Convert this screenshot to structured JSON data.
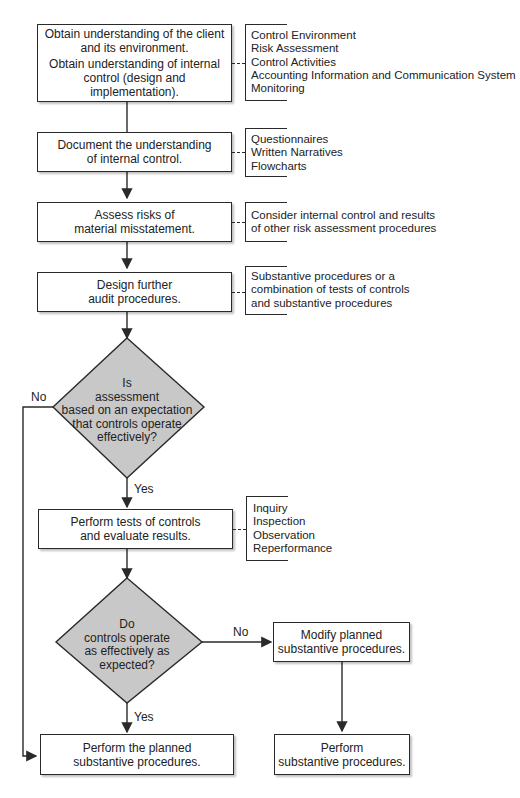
{
  "flowchart": {
    "steps": {
      "obtain": {
        "lines": [
          "Obtain understanding of the client",
          "and its environment.",
          "Obtain understanding of internal",
          "control (design and implementation)."
        ]
      },
      "document": {
        "lines": [
          "Document the understanding",
          "of internal control."
        ]
      },
      "assess": {
        "lines": [
          "Assess risks of",
          "material misstatement."
        ]
      },
      "design": {
        "lines": [
          "Design further",
          "audit procedures."
        ]
      },
      "tests": {
        "lines": [
          "Perform tests of controls",
          "and evaluate results."
        ]
      },
      "perform_planned": {
        "lines": [
          "Perform the planned",
          "substantive procedures."
        ]
      },
      "modify": {
        "lines": [
          "Modify planned",
          "substantive procedures."
        ]
      },
      "perform_sub": {
        "lines": [
          "Perform",
          "substantive procedures."
        ]
      }
    },
    "decisions": {
      "d1": {
        "lines": [
          "Is",
          "assessment",
          "based on an expectation",
          "that controls operate",
          "effectively?"
        ],
        "no": "No",
        "yes": "Yes"
      },
      "d2": {
        "lines": [
          "Do",
          "controls operate",
          "as effectively as",
          "expected?"
        ],
        "no": "No",
        "yes": "Yes"
      }
    },
    "notes": {
      "obtain": [
        "Control Environment",
        "Risk Assessment",
        "Control Activities",
        "Accounting Information and Communication System",
        "Monitoring"
      ],
      "document": [
        "Questionnaires",
        "Written Narratives",
        "Flowcharts"
      ],
      "assess": [
        "Consider internal control and results",
        "of other risk assessment procedures"
      ],
      "design": [
        "Substantive procedures or a",
        "combination of tests of controls",
        "and substantive procedures"
      ],
      "tests": [
        "Inquiry",
        "Inspection",
        "Observation",
        "Reperformance"
      ]
    },
    "colors": {
      "diamond_fill": "#c8c8c8",
      "stroke": "#2a2a2a"
    }
  }
}
